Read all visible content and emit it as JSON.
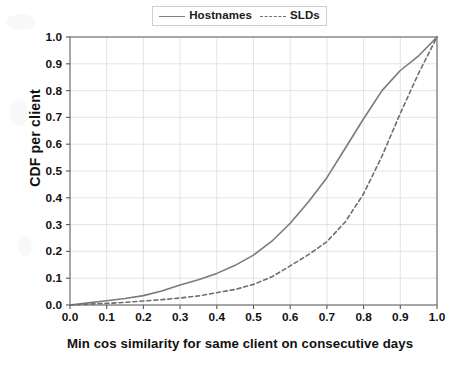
{
  "chart_data": {
    "type": "line",
    "title": "",
    "xlabel": "Min cos similarity for same client on consecutive days",
    "ylabel": "CDF per client",
    "xlim": [
      0.0,
      1.0
    ],
    "ylim": [
      0.0,
      1.0
    ],
    "grid": true,
    "legend_position": "top-center",
    "xticks": [
      "0.0",
      "0.1",
      "0.2",
      "0.3",
      "0.4",
      "0.5",
      "0.6",
      "0.7",
      "0.8",
      "0.9",
      "1.0"
    ],
    "yticks": [
      "0.0",
      "0.1",
      "0.2",
      "0.3",
      "0.4",
      "0.5",
      "0.6",
      "0.7",
      "0.8",
      "0.9",
      "1.0"
    ],
    "x": [
      0.0,
      0.05,
      0.1,
      0.15,
      0.2,
      0.25,
      0.3,
      0.35,
      0.4,
      0.45,
      0.5,
      0.55,
      0.6,
      0.65,
      0.7,
      0.75,
      0.8,
      0.85,
      0.9,
      0.95,
      1.0
    ],
    "series": [
      {
        "name": "Hostnames",
        "style": "solid",
        "color": "#7a7a7a",
        "values": [
          0.0,
          0.008,
          0.016,
          0.024,
          0.035,
          0.052,
          0.075,
          0.094,
          0.118,
          0.148,
          0.186,
          0.238,
          0.305,
          0.385,
          0.475,
          0.585,
          0.695,
          0.8,
          0.875,
          0.93,
          1.0
        ]
      },
      {
        "name": "SLDs",
        "style": "dashed",
        "color": "#6e6e6e",
        "values": [
          0.0,
          0.003,
          0.006,
          0.01,
          0.015,
          0.02,
          0.026,
          0.034,
          0.046,
          0.058,
          0.077,
          0.105,
          0.146,
          0.188,
          0.236,
          0.31,
          0.415,
          0.555,
          0.715,
          0.865,
          1.0
        ]
      }
    ]
  },
  "legend": {
    "entries": [
      {
        "label": "Hostnames",
        "style": "solid"
      },
      {
        "label": "SLDs",
        "style": "dashed"
      }
    ]
  },
  "axes": {
    "x_title": "Min cos similarity for same client on consecutive days",
    "y_title": "CDF per client"
  },
  "colors": {
    "hostnames": "#7a7a7a",
    "slds": "#6e6e6e",
    "grid": "#d8d8d8",
    "axis": "#555555",
    "background": "#ffffff"
  }
}
